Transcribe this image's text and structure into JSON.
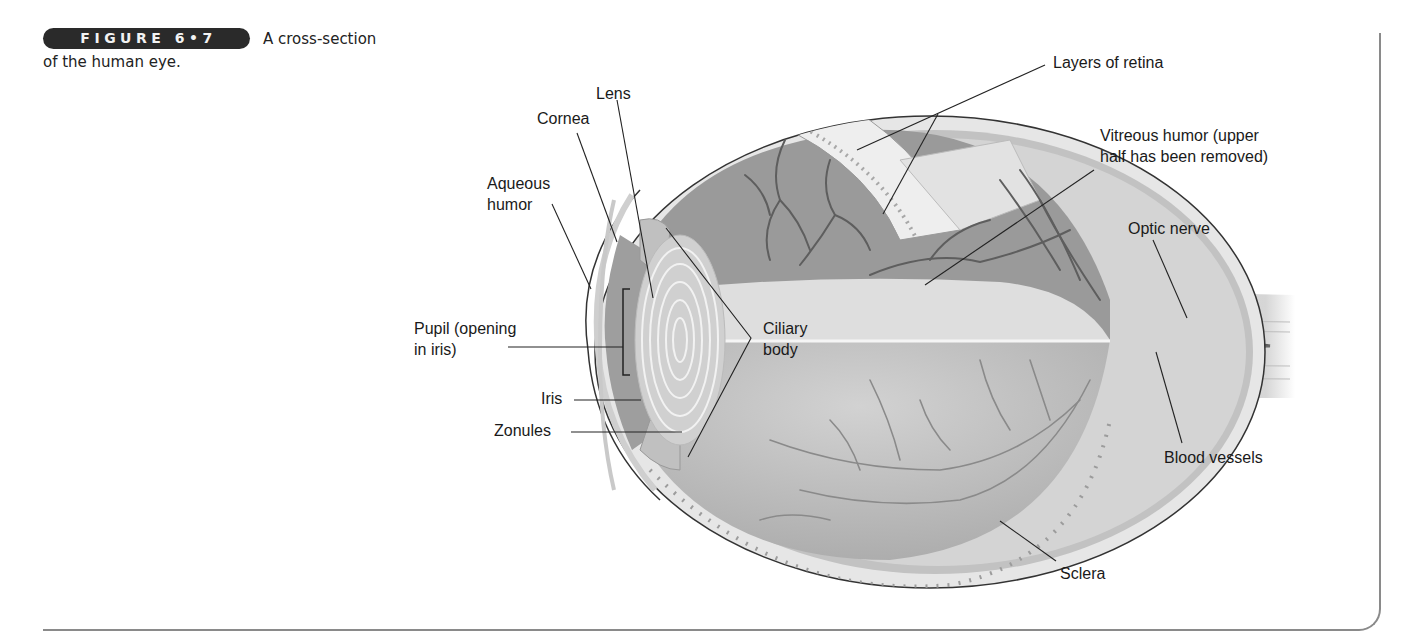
{
  "figure": {
    "badge": "FIGURE 6•7",
    "caption_line1": "A cross-section",
    "caption_line2": "of the human eye."
  },
  "labels": {
    "lens": "Lens",
    "cornea": "Cornea",
    "aqueous_humor_1": "Aqueous",
    "aqueous_humor_2": "humor",
    "pupil_1": "Pupil (opening",
    "pupil_2": "in iris)",
    "iris": "Iris",
    "zonules": "Zonules",
    "ciliary_body_1": "Ciliary",
    "ciliary_body_2": "body",
    "layers_of_retina": "Layers of retina",
    "vitreous_humor_1": "Vitreous humor (upper",
    "vitreous_humor_2": "half has been removed)",
    "optic_nerve": "Optic nerve",
    "blood_vessels": "Blood vessels",
    "sclera": "Sclera"
  },
  "colors": {
    "badge_bg": "#2a2a2a",
    "frame": "#8a8a8a",
    "eye_dark": "#8c8c8c",
    "eye_mid": "#b4b4b4",
    "eye_light": "#dcdcdc",
    "vessel": "#5a5a5a"
  }
}
